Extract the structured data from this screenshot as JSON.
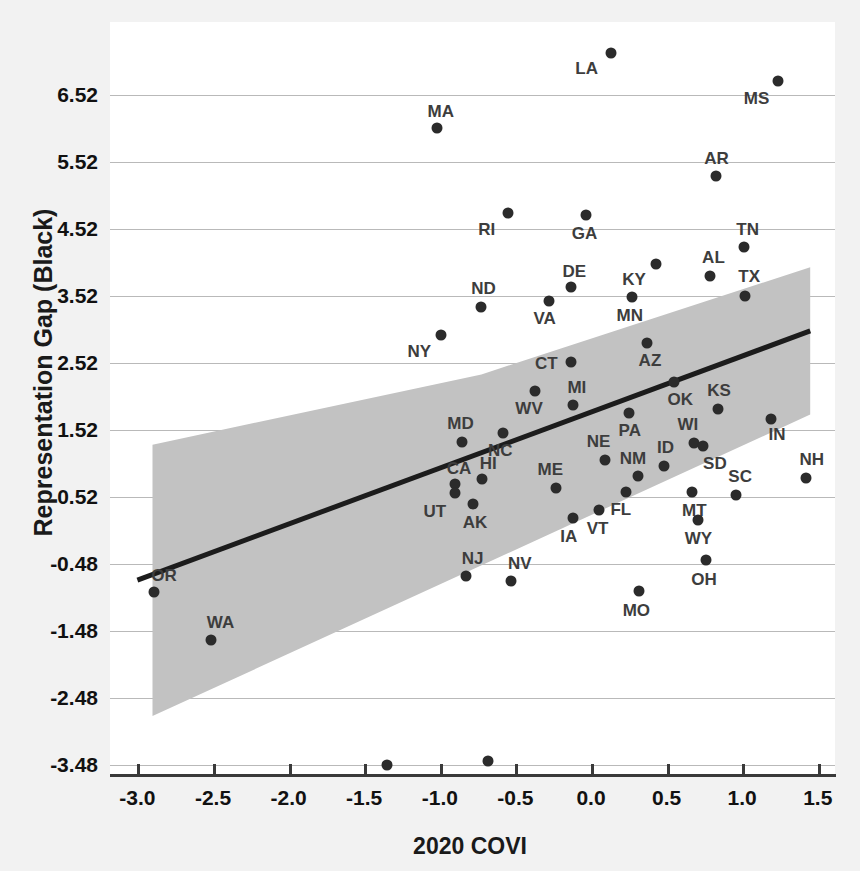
{
  "chart_data": {
    "type": "scatter",
    "title": "",
    "xlabel": "2020 COVI",
    "ylabel": "Representation Gap (Black)",
    "xlim": [
      -3.2,
      1.62
    ],
    "ylim": [
      -3.93,
      7.6
    ],
    "xticks": [
      "-3.0",
      "-2.5",
      "-2.0",
      "-1.5",
      "-1.0",
      "-0.5",
      "0.0",
      "0.5",
      "1.0",
      "1.5"
    ],
    "xtick_values": [
      -3.0,
      -2.5,
      -2.0,
      -1.5,
      -1.0,
      -0.5,
      0.0,
      0.5,
      1.0,
      1.5
    ],
    "yticks": [
      "6.52",
      "5.52",
      "4.52",
      "3.52",
      "2.52",
      "1.52",
      "0.52",
      "-0.48",
      "-1.48",
      "-2.48",
      "-3.48"
    ],
    "ytick_values": [
      6.52,
      5.52,
      4.52,
      3.52,
      2.52,
      1.52,
      0.52,
      -0.48,
      -1.48,
      -2.48,
      -3.48
    ],
    "grid": "horizontal",
    "legend": "none",
    "point_color": "#2b2b2b",
    "line_color": "#1c1c1c",
    "band_color": "#c2c2c2",
    "grid_color": "#b9b9b9",
    "background_color": "#f2f2f2",
    "plot_background_color": "#ffffff",
    "fit_line": {
      "label": "linear fit",
      "x_start": -3.0,
      "y_start": -0.72,
      "x_end": 1.45,
      "y_end": 3.0
    },
    "confidence_band": {
      "label": "95% confidence interval",
      "x_start": -2.9,
      "upper_start": 1.3,
      "lower_start": -2.75,
      "x_end": 1.45,
      "upper_end": 3.95,
      "upper_mid": 2.35,
      "lower_end": 1.75
    },
    "point_label_field": "state",
    "points": [
      {
        "state": "LA",
        "x": 0.13,
        "y": 7.15,
        "lx": -24,
        "ly": 16
      },
      {
        "state": "MS",
        "x": 1.24,
        "y": 6.73,
        "lx": -22,
        "ly": 18
      },
      {
        "state": "MA",
        "x": -1.02,
        "y": 6.03,
        "lx": 4,
        "ly": -16
      },
      {
        "state": "AR",
        "x": 0.83,
        "y": 5.31,
        "lx": 0,
        "ly": -17
      },
      {
        "state": "RI",
        "x": -0.55,
        "y": 4.76,
        "lx": -21,
        "ly": 17
      },
      {
        "state": "GA",
        "x": -0.03,
        "y": 4.73,
        "lx": -2,
        "ly": 19
      },
      {
        "state": "TN",
        "x": 1.01,
        "y": 4.25,
        "lx": 4,
        "ly": -17
      },
      {
        "state": "KY",
        "x": 0.43,
        "y": 4.0,
        "lx": -22,
        "ly": 16
      },
      {
        "state": "AL",
        "x": 0.79,
        "y": 3.82,
        "lx": 3,
        "ly": -18
      },
      {
        "state": "TX",
        "x": 1.02,
        "y": 3.52,
        "lx": 4,
        "ly": -19
      },
      {
        "state": "DE",
        "x": -0.13,
        "y": 3.65,
        "lx": 3,
        "ly": -15
      },
      {
        "state": "ND",
        "x": -0.73,
        "y": 3.35,
        "lx": 3,
        "ly": -18
      },
      {
        "state": "VA",
        "x": -0.28,
        "y": 3.44,
        "lx": -4,
        "ly": 18
      },
      {
        "state": "MN",
        "x": 0.27,
        "y": 3.5,
        "lx": -2,
        "ly": 19
      },
      {
        "state": "NY",
        "x": -0.99,
        "y": 2.94,
        "lx": -22,
        "ly": 17
      },
      {
        "state": "AZ",
        "x": 0.37,
        "y": 2.82,
        "lx": 3,
        "ly": 18
      },
      {
        "state": "CT",
        "x": -0.13,
        "y": 2.54,
        "lx": -25,
        "ly": 2
      },
      {
        "state": "OK",
        "x": 0.55,
        "y": 2.24,
        "lx": 6,
        "ly": 18
      },
      {
        "state": "WV",
        "x": -0.37,
        "y": 2.1,
        "lx": -6,
        "ly": 18
      },
      {
        "state": "MI",
        "x": -0.12,
        "y": 1.9,
        "lx": 4,
        "ly": -17
      },
      {
        "state": "KS",
        "x": 0.84,
        "y": 1.84,
        "lx": 1,
        "ly": -18
      },
      {
        "state": "PA",
        "x": 0.25,
        "y": 1.77,
        "lx": 1,
        "ly": 18
      },
      {
        "state": "IN",
        "x": 1.19,
        "y": 1.69,
        "lx": 6,
        "ly": 16
      },
      {
        "state": "MD",
        "x": -0.85,
        "y": 1.34,
        "lx": -2,
        "ly": -18
      },
      {
        "state": "NC",
        "x": -0.58,
        "y": 1.47,
        "lx": -3,
        "ly": 18
      },
      {
        "state": "WI",
        "x": 0.68,
        "y": 1.33,
        "lx": -6,
        "ly": -18
      },
      {
        "state": "SD",
        "x": 0.74,
        "y": 1.28,
        "lx": 12,
        "ly": 18
      },
      {
        "state": "NE",
        "x": 0.09,
        "y": 1.07,
        "lx": -6,
        "ly": -18
      },
      {
        "state": "NM",
        "x": 0.31,
        "y": 0.83,
        "lx": -5,
        "ly": -17
      },
      {
        "state": "ID",
        "x": 0.48,
        "y": 0.98,
        "lx": 2,
        "ly": -18
      },
      {
        "state": "NH",
        "x": 1.42,
        "y": 0.8,
        "lx": 6,
        "ly": -18
      },
      {
        "state": "ME",
        "x": -0.23,
        "y": 0.66,
        "lx": -6,
        "ly": -18
      },
      {
        "state": "FL",
        "x": 0.23,
        "y": 0.6,
        "lx": -5,
        "ly": 18
      },
      {
        "state": "MT",
        "x": 0.67,
        "y": 0.6,
        "lx": 2,
        "ly": 19
      },
      {
        "state": "SC",
        "x": 0.96,
        "y": 0.55,
        "lx": 4,
        "ly": -18
      },
      {
        "state": "CA",
        "x": -0.9,
        "y": 0.72,
        "lx": 4,
        "ly": -15
      },
      {
        "state": "HI",
        "x": -0.72,
        "y": 0.79,
        "lx": 6,
        "ly": -15
      },
      {
        "state": "UT",
        "x": -0.9,
        "y": 0.58,
        "lx": -20,
        "ly": 19
      },
      {
        "state": "AK",
        "x": -0.78,
        "y": 0.42,
        "lx": 2,
        "ly": 19
      },
      {
        "state": "VT",
        "x": 0.05,
        "y": 0.33,
        "lx": -1,
        "ly": 19
      },
      {
        "state": "IA",
        "x": -0.12,
        "y": 0.2,
        "lx": -4,
        "ly": 19
      },
      {
        "state": "WY",
        "x": 0.71,
        "y": 0.17,
        "lx": 0,
        "ly": 19
      },
      {
        "state": "OH",
        "x": 0.76,
        "y": -0.42,
        "lx": -2,
        "ly": 20
      },
      {
        "state": "NJ",
        "x": -0.83,
        "y": -0.66,
        "lx": 7,
        "ly": -17
      },
      {
        "state": "NV",
        "x": -0.53,
        "y": -0.73,
        "lx": 9,
        "ly": -17
      },
      {
        "state": "MO",
        "x": 0.32,
        "y": -0.88,
        "lx": -3,
        "ly": 20
      },
      {
        "state": "OR",
        "x": -2.89,
        "y": -0.9,
        "lx": 10,
        "ly": -16
      },
      {
        "state": "WA",
        "x": -2.51,
        "y": -1.62,
        "lx": 9,
        "ly": -17
      },
      {
        "state": "IL",
        "x": -1.35,
        "y": -3.48,
        "lx": -3,
        "ly": 20
      },
      {
        "state": "CO",
        "x": -0.68,
        "y": -3.42,
        "lx": -2,
        "ly": 20
      }
    ]
  }
}
